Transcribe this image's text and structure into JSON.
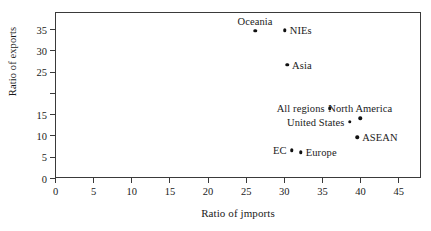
{
  "chart_data": {
    "type": "scatter",
    "title": "",
    "xlabel": "Ratio of jmports",
    "ylabel": "Ratio of exports",
    "xlim": [
      0,
      48
    ],
    "ylim": [
      0,
      39
    ],
    "grid": false,
    "legend": "none",
    "xticks": [
      {
        "value": 0,
        "label": "0"
      },
      {
        "value": 5,
        "label": "5"
      },
      {
        "value": 10,
        "label": "10"
      },
      {
        "value": 15,
        "label": "15"
      },
      {
        "value": 20,
        "label": "20"
      },
      {
        "value": 25,
        "label": "25"
      },
      {
        "value": 30,
        "label": "30"
      },
      {
        "value": 35,
        "label": "35"
      },
      {
        "value": 40,
        "label": "40"
      },
      {
        "value": 45,
        "label": "45"
      }
    ],
    "yticks": [
      {
        "value": 0,
        "label": "0"
      },
      {
        "value": 5,
        "label": "5"
      },
      {
        "value": 10,
        "label": "10"
      },
      {
        "value": 15,
        "label": "15"
      },
      {
        "value": 20,
        "label": ""
      },
      {
        "value": 25,
        "label": "25"
      },
      {
        "value": 30,
        "label": "30"
      },
      {
        "value": 35,
        "label": "35"
      }
    ],
    "points": [
      {
        "name": "Oceania",
        "x": 26.1,
        "y": 34.8,
        "label_pos": "above"
      },
      {
        "name": "NIEs",
        "x": 30.0,
        "y": 35.0,
        "label_pos": "right"
      },
      {
        "name": "Asia",
        "x": 30.3,
        "y": 26.8,
        "label_pos": "right"
      },
      {
        "name": "All regions",
        "x": 35.9,
        "y": 16.6,
        "label_pos": "left"
      },
      {
        "name": "North America",
        "x": 39.9,
        "y": 14.3,
        "label_pos": "above"
      },
      {
        "name": "United States",
        "x": 38.5,
        "y": 13.5,
        "label_pos": "left"
      },
      {
        "name": "ASEAN",
        "x": 39.5,
        "y": 9.8,
        "label_pos": "right"
      },
      {
        "name": "EC",
        "x": 30.9,
        "y": 6.8,
        "label_pos": "left"
      },
      {
        "name": "Europe",
        "x": 32.1,
        "y": 6.3,
        "label_pos": "right"
      }
    ]
  }
}
